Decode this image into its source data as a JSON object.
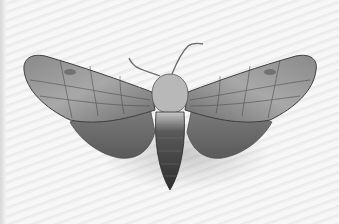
{
  "image": {
    "subject": "Moth specimen, wings spread, dorsal view",
    "description": "Grayscale photograph of a pinned moth with mottled gray-brown patterned wings and antennae on a light striped background",
    "colors": {
      "background": "#f4f4f4",
      "wing_light": "#a9a9a9",
      "wing_dark": "#4a4a4a",
      "body": "#3a3a3a"
    }
  }
}
